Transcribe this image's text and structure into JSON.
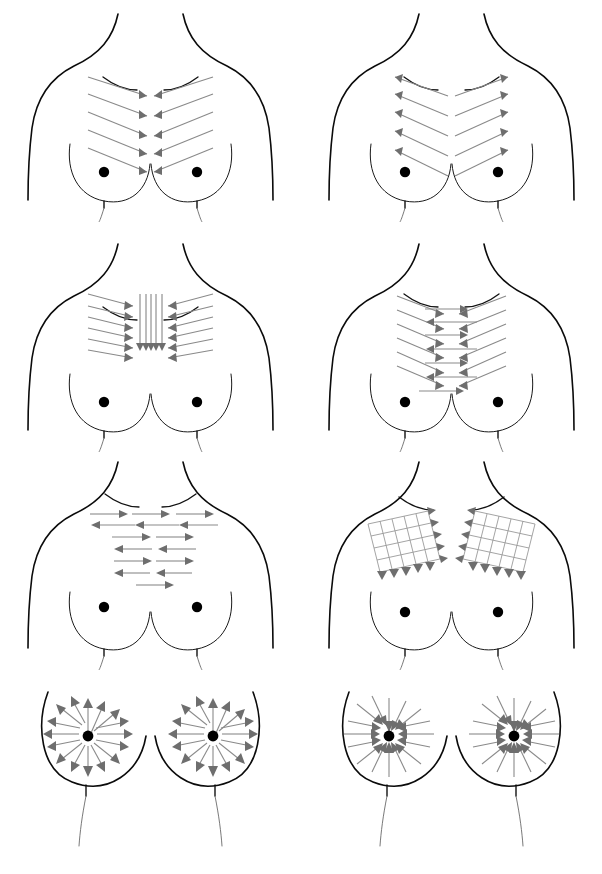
{
  "document": {
    "title": "Breast Massage / Lymphatic Drainage Direction Chart",
    "sheet_width": 602,
    "sheet_height": 874,
    "background_color": "#ffffff",
    "outline_color": "#0b0b0b",
    "arrow_color": "#8a8a8a",
    "arrowhead_color": "#6e6e6e",
    "nipple_color": "#000000",
    "grid_rows": 4,
    "grid_columns": 2,
    "panel_count": 8
  },
  "panels": [
    {
      "index": 1,
      "position": "row1-left",
      "name": "chevron-inward",
      "pattern_type": "chevron",
      "direction": "inward-to-sternum",
      "stroke_rows": 5,
      "description": "Five nested V-shaped chevron strokes sweeping from both outer chest toward the midline sternum, arrowheads meeting at center.",
      "arrowheads_at": "center",
      "torso_view": "upper-chest"
    },
    {
      "index": 2,
      "position": "row1-right",
      "name": "chevron-outward",
      "pattern_type": "chevron",
      "direction": "outward-from-sternum",
      "stroke_rows": 5,
      "description": "Five nested V-shaped chevron strokes originating at the midline and sweeping outward toward the axillae, arrowheads at the outer ends.",
      "arrowheads_at": "outer-ends",
      "torso_view": "upper-chest"
    },
    {
      "index": 3,
      "position": "row2-left",
      "name": "converging-diagonal-with-vertical",
      "pattern_type": "diagonal-plus-vertical",
      "direction": "inward-and-downward",
      "stroke_rows": 6,
      "vertical_lines": 5,
      "description": "Diagonal strokes converging inward from both sides combined with vertical midline strokes travelling downward, arrowheads stacked at the sternum.",
      "arrowheads_at": "center-and-bottom",
      "torso_view": "upper-chest"
    },
    {
      "index": 4,
      "position": "row2-right",
      "name": "chevron-inward-with-horizontal",
      "pattern_type": "chevron-plus-horizontal",
      "direction": "inward-and-crossing",
      "stroke_rows": 6,
      "description": "Inward chevron strokes overlaid with horizontal crossing strokes that pass through the midline, creating paired opposing arrowheads.",
      "arrowheads_at": "center-and-both-ends",
      "torso_view": "upper-chest"
    },
    {
      "index": 5,
      "position": "row3-left",
      "name": "horizontal-alternating",
      "pattern_type": "horizontal",
      "direction": "alternating-left-right",
      "stroke_rows": 7,
      "description": "Seven horizontal sweep rows alternating direction — right-pointing rows interleaved with left-pointing rows, rows narrowing toward the bottom.",
      "arrowheads_at": "row-ends",
      "torso_view": "upper-chest"
    },
    {
      "index": 6,
      "position": "row3-right",
      "name": "crosshatch-grid",
      "pattern_type": "grid",
      "direction": "outward-and-downward",
      "grid_cells": "5 x 5 per side",
      "description": "A slanted crosshatch grid over each breast quadrant; left grid arrows exit to the right and downward, right grid arrows exit to the left and downward.",
      "arrowheads_at": "grid-edges",
      "torso_view": "upper-chest"
    },
    {
      "index": 7,
      "position": "row4-left",
      "name": "radial-outward",
      "pattern_type": "radial",
      "direction": "outward-from-nipple",
      "ray_count": 16,
      "description": "Sixteen radial spokes per breast emanating outward from the nipple toward the periphery.",
      "arrowheads_at": "outer-ends",
      "torso_view": "breasts-only"
    },
    {
      "index": 8,
      "position": "row4-right",
      "name": "radial-inward",
      "pattern_type": "radial",
      "direction": "inward-to-nipple",
      "ray_count": 16,
      "description": "Sixteen radial spokes per breast converging inward from the periphery toward the nipple.",
      "arrowheads_at": "nipple",
      "torso_view": "breasts-only"
    }
  ],
  "legend": {
    "nipple_label": "nipple marker",
    "outline_label": "female torso outline",
    "arrow_label": "stroke direction arrow"
  }
}
